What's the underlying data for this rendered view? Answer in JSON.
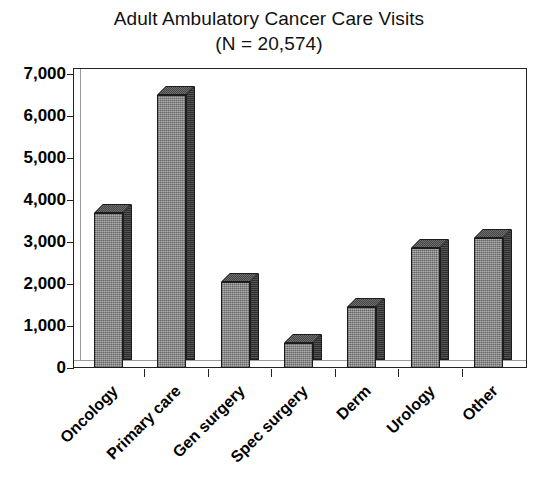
{
  "chart_data": {
    "type": "bar",
    "title": "Adult Ambulatory Cancer Care Visits",
    "subtitle": "(N = 20,574)",
    "xlabel": "",
    "ylabel": "",
    "categories": [
      "Oncology",
      "Primary care",
      "Gen surgery",
      "Spec surgery",
      "Derm",
      "Urology",
      "Other"
    ],
    "values": [
      3700,
      6500,
      2050,
      600,
      1450,
      2850,
      3100
    ],
    "ylim": [
      0,
      7000
    ],
    "ytick_values": [
      0,
      1000,
      2000,
      3000,
      4000,
      5000,
      6000,
      7000
    ],
    "ytick_labels": [
      "0",
      "1,000",
      "2,000",
      "3,000",
      "4,000",
      "5,000",
      "6,000",
      "7,000"
    ],
    "grid": false,
    "legend": "none",
    "style": "3d-column",
    "bar_face_color": "#8f8f8f",
    "bar_side_color": "#3e3e3e",
    "bar_top_color": "#5a5a5a",
    "bar_edge_color": "#1c1c1c",
    "axis_color": "#222222",
    "background_color": "#ffffff"
  },
  "figure": {
    "title_line_1": "Adult Ambulatory Cancer Care Visits",
    "title_line_2": "(N = 20,574)"
  }
}
